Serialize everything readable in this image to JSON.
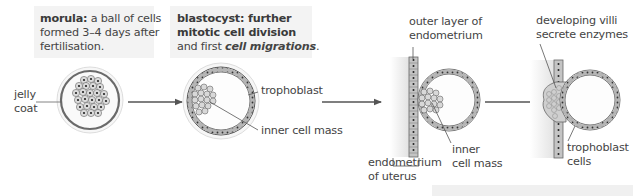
{
  "captions": {
    "morula": {
      "term": "morula:",
      "line1_rest": " a ball of cells",
      "line2": "formed 3–4 days after",
      "line3": "fertilisation."
    },
    "blastocyst": {
      "line1": "blastocyst: further",
      "line2": "mitotic cell division",
      "line3_plain": "and first ",
      "line3_bold_italic_1": "cell ",
      "line3_bold_italic_2": "migrations",
      "line3_end": "."
    }
  },
  "labels": {
    "jelly_coat_1": "jelly",
    "jelly_coat_2": "coat",
    "trophoblast": "trophoblast",
    "inner_cell_mass": "inner cell mass",
    "outer_layer_1": "outer layer of",
    "outer_layer_2": "endometrium",
    "endometrium_uterus_1": "endometrium",
    "endometrium_uterus_2": "of uterus",
    "inner_cell_mass_2_line1": "inner",
    "inner_cell_mass_2_line2": "cell mass",
    "villi_1": "developing villi",
    "villi_2": "secrete enzymes",
    "trophoblast_cells_1": "trophoblast",
    "trophoblast_cells_2": "cells"
  },
  "stages": [
    "morula",
    "blastocyst",
    "attachment to endometrium",
    "implantation"
  ],
  "colors": {
    "line": "#555555",
    "membrane": "#6a6a6a",
    "cell_fill": "#d9d9d9",
    "nucleus": "#222222",
    "caption_bg": "#f3f3f3",
    "tissue_shade": "#e6e6e6"
  }
}
